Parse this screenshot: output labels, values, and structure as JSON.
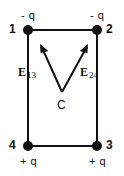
{
  "figure": {
    "background_color": "#ffffff",
    "ink_color": "#111111",
    "width": 124,
    "height": 176
  },
  "corners": [
    {
      "id": "1",
      "number": "1",
      "charge": "- q",
      "x": 28,
      "y": 30,
      "number_side": "left",
      "charge_side": "above"
    },
    {
      "id": "2",
      "number": "2",
      "charge": "- q",
      "x": 97,
      "y": 30,
      "number_side": "right",
      "charge_side": "above"
    },
    {
      "id": "3",
      "number": "3",
      "charge": "+ q",
      "x": 97,
      "y": 146,
      "number_side": "right",
      "charge_side": "below"
    },
    {
      "id": "4",
      "number": "4",
      "charge": "+ q",
      "x": 28,
      "y": 146,
      "number_side": "left",
      "charge_side": "below"
    }
  ],
  "vectors": [
    {
      "id": "E13",
      "symbol": "E",
      "subscript": "13",
      "label_x": 18,
      "label_y": 66,
      "tail_x": 62,
      "tail_y": 92,
      "tip_x": 40,
      "tip_y": 44
    },
    {
      "id": "E24",
      "symbol": "E",
      "subscript": "24",
      "label_x": 80,
      "label_y": 66,
      "tail_x": 62,
      "tail_y": 92,
      "tip_x": 88,
      "tip_y": 44
    }
  ],
  "center_point": {
    "label": "C",
    "x": 62,
    "y": 105
  },
  "rectangle": {
    "left": 28,
    "right": 97,
    "top": 30,
    "bottom": 146,
    "stroke_width": 2
  },
  "node_radius": 5
}
